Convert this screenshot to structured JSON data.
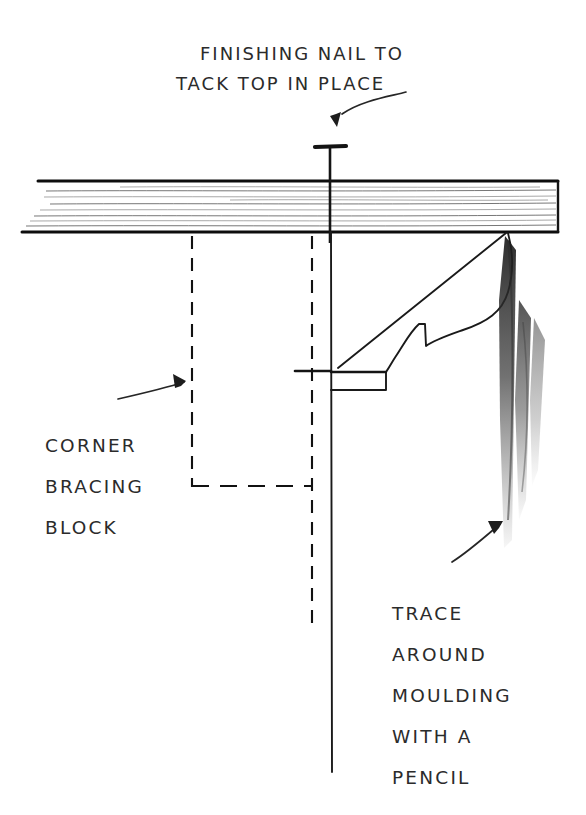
{
  "figure": {
    "kind": "hand-drawn woodworking instruction sketch",
    "background_color": "#ffffff",
    "ink_color": "#141414",
    "title_absent": true
  },
  "labels": {
    "nail_note": {
      "name": "finishing-nail-note",
      "lines": [
        "FINISHING NAIL TO",
        "TACK TOP IN PLACE"
      ],
      "x": [
        200,
        176
      ],
      "y": [
        60,
        90
      ]
    },
    "block_note": {
      "name": "corner-bracing-block-note",
      "lines": [
        "CORNER",
        "BRACING",
        "BLOCK"
      ],
      "x": [
        45,
        45,
        45
      ],
      "y": [
        452,
        493,
        534
      ]
    },
    "trace_note": {
      "name": "trace-around-moulding-note",
      "lines": [
        "TRACE",
        "AROUND",
        "MOULDING",
        "WITH A",
        "PENCIL"
      ],
      "x": [
        392,
        392,
        392,
        392,
        392
      ],
      "y": [
        620,
        661,
        702,
        743,
        784
      ]
    }
  },
  "parts": {
    "tabletop": {
      "name": "table-top-board",
      "top_edge_y": 181,
      "bottom_edge_y": 232,
      "left_x": 22,
      "right_x": 558,
      "grain_lines": 9
    },
    "nail": {
      "name": "finishing-nail",
      "head_x": 330,
      "head_y": 146,
      "head_width": 30,
      "shaft_bottom_y": 243
    },
    "moulding": {
      "name": "crown-moulding-profile",
      "top_point": [
        508,
        232
      ],
      "back_line_end": [
        338,
        368
      ],
      "notch": {
        "x": 331,
        "y": 372,
        "w": 55,
        "h": 18
      }
    },
    "leg": {
      "name": "table-leg-edge",
      "x": 331,
      "top_y": 232,
      "bottom_y": 772
    },
    "bracing_block": {
      "name": "corner-bracing-block-outline",
      "left_dash_x": 192,
      "right_dash_x": 312,
      "dash_top_y": 235,
      "left_dash_bottom_y": 487,
      "cross_dash_y": 486,
      "right_dash_bottom_y": 632
    },
    "shading": {
      "name": "pencil-shadow-smudge",
      "x_start": 505,
      "y_start": 236,
      "y_end": 548,
      "stroke_count": 3
    }
  },
  "arrows": [
    {
      "name": "arrow-to-nail",
      "from": [
        406,
        92
      ],
      "to": [
        334,
        120
      ],
      "style": "curved"
    },
    {
      "name": "arrow-to-bracing-block",
      "from": [
        118,
        398
      ],
      "to": [
        190,
        381
      ],
      "style": "curved"
    },
    {
      "name": "arrow-to-moulding-shading",
      "from": [
        452,
        562
      ],
      "to": [
        508,
        518
      ],
      "style": "straight"
    }
  ]
}
